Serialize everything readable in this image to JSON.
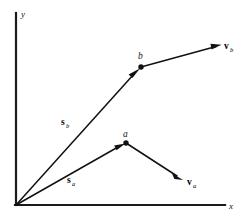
{
  "figure": {
    "type": "vector-diagram",
    "background_color": "#ffffff",
    "line_color": "#111111",
    "axis_color": "#1a1a1a",
    "axes": {
      "origin": {
        "x": 16,
        "y": 205
      },
      "y_axis": {
        "label": "y",
        "from": {
          "x": 16,
          "y": 205
        },
        "to": {
          "x": 16,
          "y": 13
        },
        "label_pos": {
          "x": 20,
          "y": 16
        }
      },
      "x_axis": {
        "label": "x",
        "from": {
          "x": 16,
          "y": 205
        },
        "to": {
          "x": 225,
          "y": 205
        },
        "label_pos": {
          "x": 229,
          "y": 209
        }
      }
    },
    "points": [
      {
        "name": "a",
        "label": "a",
        "x": 126,
        "y": 143,
        "label_pos": {
          "x": 123,
          "y": 137
        },
        "radius": 2.6
      },
      {
        "name": "b",
        "label": "b",
        "x": 141,
        "y": 67,
        "label_pos": {
          "x": 138,
          "y": 59
        },
        "radius": 2.6
      }
    ],
    "vectors": [
      {
        "name": "s_a",
        "main": "s",
        "sub": "a",
        "kind": "position",
        "from": {
          "x": 16,
          "y": 205
        },
        "to": {
          "x": 126,
          "y": 143
        },
        "label_pos": {
          "x": 68,
          "y": 183
        }
      },
      {
        "name": "s_b",
        "main": "s",
        "sub": "b",
        "kind": "position",
        "from": {
          "x": 16,
          "y": 205
        },
        "to": {
          "x": 141,
          "y": 67
        },
        "label_pos": {
          "x": 62,
          "y": 125
        }
      },
      {
        "name": "v_a",
        "main": "v",
        "sub": "a",
        "kind": "velocity",
        "from": {
          "x": 126,
          "y": 143
        },
        "to": {
          "x": 183,
          "y": 180
        },
        "label_pos": {
          "x": 188,
          "y": 185
        }
      },
      {
        "name": "v_b",
        "main": "v",
        "sub": "b",
        "kind": "velocity",
        "from": {
          "x": 141,
          "y": 67
        },
        "to": {
          "x": 221,
          "y": 45
        },
        "label_pos": {
          "x": 225,
          "y": 49
        }
      }
    ]
  }
}
